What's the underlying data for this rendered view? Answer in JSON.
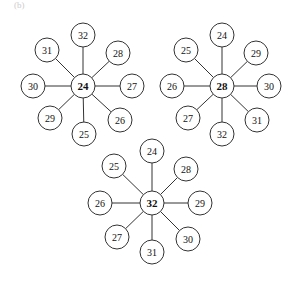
{
  "caption": "(b)",
  "stars": [
    {
      "name": "star-24",
      "cx": 83,
      "cy": 86,
      "center": "24",
      "leaves": [
        {
          "label": "32",
          "x": 83,
          "y": 35
        },
        {
          "label": "28",
          "x": 118,
          "y": 53
        },
        {
          "label": "27",
          "x": 132,
          "y": 86
        },
        {
          "label": "26",
          "x": 120,
          "y": 120
        },
        {
          "label": "25",
          "x": 84,
          "y": 134
        },
        {
          "label": "29",
          "x": 50,
          "y": 118
        },
        {
          "label": "30",
          "x": 33,
          "y": 86
        },
        {
          "label": "31",
          "x": 47,
          "y": 50
        }
      ]
    },
    {
      "name": "star-28",
      "cx": 222,
      "cy": 86,
      "center": "28",
      "leaves": [
        {
          "label": "24",
          "x": 222,
          "y": 35
        },
        {
          "label": "29",
          "x": 256,
          "y": 53
        },
        {
          "label": "30",
          "x": 269,
          "y": 86
        },
        {
          "label": "31",
          "x": 257,
          "y": 120
        },
        {
          "label": "32",
          "x": 222,
          "y": 134
        },
        {
          "label": "27",
          "x": 188,
          "y": 118
        },
        {
          "label": "26",
          "x": 172,
          "y": 86
        },
        {
          "label": "25",
          "x": 186,
          "y": 50
        }
      ]
    },
    {
      "name": "star-32",
      "cx": 152,
      "cy": 203,
      "center": "32",
      "leaves": [
        {
          "label": "24",
          "x": 152,
          "y": 151
        },
        {
          "label": "28",
          "x": 186,
          "y": 169
        },
        {
          "label": "29",
          "x": 200,
          "y": 203
        },
        {
          "label": "30",
          "x": 188,
          "y": 239
        },
        {
          "label": "31",
          "x": 152,
          "y": 252
        },
        {
          "label": "27",
          "x": 117,
          "y": 237
        },
        {
          "label": "26",
          "x": 100,
          "y": 203
        },
        {
          "label": "25",
          "x": 114,
          "y": 166
        }
      ]
    }
  ],
  "radius": 12
}
